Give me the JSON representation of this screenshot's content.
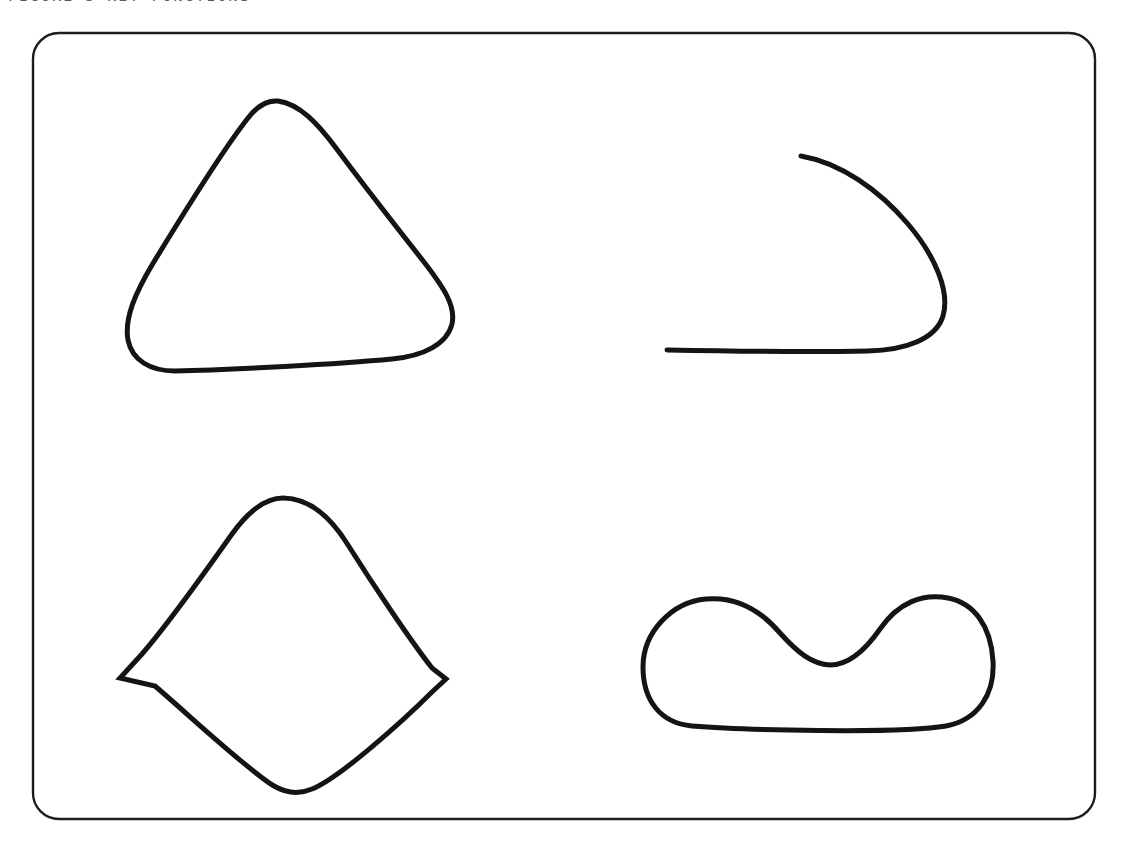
{
  "page": {
    "background_color": "#ffffff",
    "width": 1121,
    "height": 844
  },
  "header": {
    "caption": "FIGURE 3  KEY FUNCTIONS",
    "clipped": "true",
    "color": "#3c3c3c"
  },
  "frame": {
    "name": "rounded-rectangle-border",
    "stroke_color": "#1c1c1c",
    "stroke_width": 2.4,
    "corner_radius": 26,
    "left": 33,
    "top": 33,
    "right": 1095,
    "bottom": 819
  },
  "figure": {
    "stroke_color": "#141414",
    "stroke_width": 5,
    "shape_count": 4,
    "shapes": [
      {
        "index": 1,
        "name": "rounded-triangle-curve",
        "label": "Rounded triangle",
        "closed": "true",
        "quadrant": "top-left",
        "bounds": {
          "x": 126,
          "y": 100,
          "width": 330,
          "height": 272
        }
      },
      {
        "index": 2,
        "name": "open-hook-curve",
        "label": "Open hook with straight tail",
        "closed": "false",
        "quadrant": "top-right",
        "bounds": {
          "x": 667,
          "y": 155,
          "width": 281,
          "height": 198
        }
      },
      {
        "index": 3,
        "name": "rounded-kite-curve",
        "label": "Kite with rounded apexes",
        "closed": "true",
        "quadrant": "bottom-left",
        "bounds": {
          "x": 120,
          "y": 497,
          "width": 327,
          "height": 297
        }
      },
      {
        "index": 4,
        "name": "kidney-bean-curve",
        "label": "Kidney bean with concave top",
        "closed": "true",
        "quadrant": "bottom-right",
        "bounds": {
          "x": 643,
          "y": 597,
          "width": 351,
          "height": 131
        }
      }
    ]
  }
}
